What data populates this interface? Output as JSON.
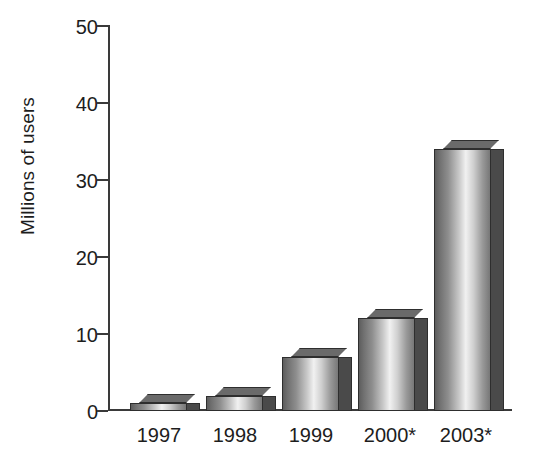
{
  "chart_data": {
    "type": "bar",
    "title": "",
    "subtitle": "",
    "xlabel": "",
    "ylabel": "Millions of users",
    "categories": [
      "1997",
      "1998",
      "1999",
      "2000*",
      "2003*"
    ],
    "values": [
      1,
      2,
      7,
      12,
      34
    ],
    "series": [
      {
        "name": "Millions of users",
        "values": [
          1,
          2,
          7,
          12,
          34
        ]
      }
    ],
    "ylim": [
      0,
      50
    ],
    "ytick_labels": [
      "0",
      "10",
      "20",
      "30",
      "40",
      "50"
    ],
    "ytick_values": [
      0,
      10,
      20,
      30,
      40,
      50
    ],
    "grid": false,
    "legend": false,
    "legend_position": "none",
    "annotations": [],
    "style": {
      "bar_style": "3d-grayscale",
      "bar_face_highlight": "#f1f1f1",
      "bar_face_shadow": "#5d5d5d",
      "bar_side_color": "#4a4a4a",
      "bar_outline": "#2e2e2e",
      "axis_color": "#3a3a3a",
      "text_color": "#1d1d1d",
      "background": "#ffffff"
    }
  },
  "axis": {
    "y_title": "Millions of users",
    "y_ticks": [
      {
        "label": "50",
        "value": 50
      },
      {
        "label": "40",
        "value": 40
      },
      {
        "label": "30",
        "value": 30
      },
      {
        "label": "20",
        "value": 20
      },
      {
        "label": "10",
        "value": 10
      },
      {
        "label": "0",
        "value": 0
      }
    ],
    "x_ticks": [
      {
        "label": "1997"
      },
      {
        "label": "1998"
      },
      {
        "label": "1999"
      },
      {
        "label": "2000*"
      },
      {
        "label": "2003*"
      }
    ]
  }
}
